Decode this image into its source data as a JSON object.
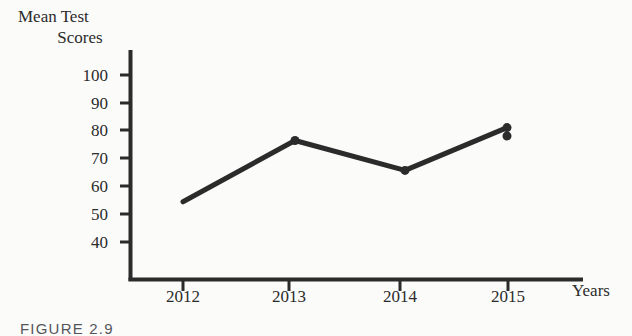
{
  "chart_data": {
    "type": "line",
    "title": "",
    "ylabel": "Mean Test Scores",
    "xlabel": "Years",
    "categories": [
      "2012",
      "2013",
      "2014",
      "2015"
    ],
    "values": [
      54,
      75.5,
      65,
      80
    ],
    "series": [
      {
        "name": "Mean Test Scores",
        "values": [
          54,
          75.5,
          65,
          80
        ]
      }
    ],
    "ylim": [
      35,
      103
    ],
    "yticks": [
      40,
      50,
      60,
      70,
      80,
      90,
      100
    ],
    "ytick_labels": [
      "40",
      "50",
      "60",
      "70",
      "80",
      "90",
      "100"
    ],
    "xtick_labels": [
      "2012",
      "2013",
      "2014",
      "2015"
    ],
    "grid": false,
    "legend": false,
    "legend_position": "none",
    "marker": "circle",
    "line_color": "#2b2b2b",
    "axis_color": "#2b2b2b",
    "background_color": "#fbfbfa"
  },
  "labels": {
    "y_axis_title_line1": "Mean Test",
    "y_axis_title_line2": "Scores",
    "x_axis_title": "Years"
  },
  "caption": {
    "text": "FIGURE 2.9"
  }
}
